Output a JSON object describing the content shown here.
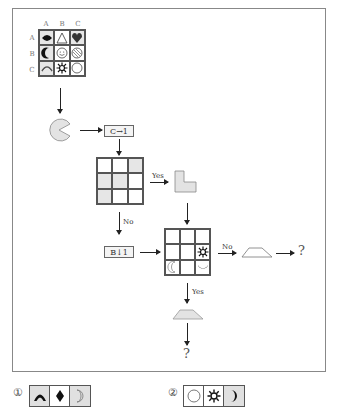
{
  "main_grid": {
    "col_headers": [
      "A",
      "B",
      "C"
    ],
    "row_headers": [
      "A",
      "B",
      "C"
    ],
    "cells": [
      [
        {
          "icon": "diamond-fish-icon",
          "shaded": true
        },
        {
          "icon": "triangle-outline-icon",
          "shaded": false
        },
        {
          "icon": "heart-icon",
          "shaded": true
        }
      ],
      [
        {
          "icon": "crescent-moon-icon",
          "shaded": true
        },
        {
          "icon": "smiley-face-icon",
          "shaded": false
        },
        {
          "icon": "striped-circle-icon",
          "shaded": false
        }
      ],
      [
        {
          "icon": "arc-icon",
          "shaded": true
        },
        {
          "icon": "sun-gear-icon",
          "shaded": false
        },
        {
          "icon": "circle-outline-icon",
          "shaded": false
        }
      ]
    ]
  },
  "flow": {
    "shape1": "pacman-icon",
    "step1_label": "C→1",
    "decision_grid_shaded": [
      [
        false,
        false,
        true
      ],
      [
        true,
        true,
        false
      ],
      [
        true,
        false,
        false
      ]
    ],
    "yes_label": "Yes",
    "no_label": "No",
    "step2_label": "B↓1",
    "l_shape": "l-shape-icon",
    "result_grid": [
      [
        "",
        "",
        ""
      ],
      [
        "",
        "",
        "sun-gear-icon"
      ],
      [
        "crescent-outline-icon",
        "",
        "bowl-moon-icon"
      ]
    ],
    "no_label_2": "No",
    "yes_label_2": "Yes",
    "trapezoid_right": "trapezoid-outline-icon",
    "trapezoid_bottom": "trapezoid-filled-icon",
    "question_right": "?",
    "question_bottom": "?"
  },
  "options": [
    {
      "number": "①",
      "cells": [
        {
          "icon": "arc-filled-icon",
          "shaded": true
        },
        {
          "icon": "diamond-icon",
          "shaded": false
        },
        {
          "icon": "crescent-outline-icon",
          "shaded": true
        }
      ]
    },
    {
      "number": "②",
      "cells": [
        {
          "icon": "circle-outline-icon",
          "shaded": false
        },
        {
          "icon": "sun-gear-icon",
          "shaded": false
        },
        {
          "icon": "crescent-moon-icon",
          "shaded": true
        }
      ]
    }
  ]
}
